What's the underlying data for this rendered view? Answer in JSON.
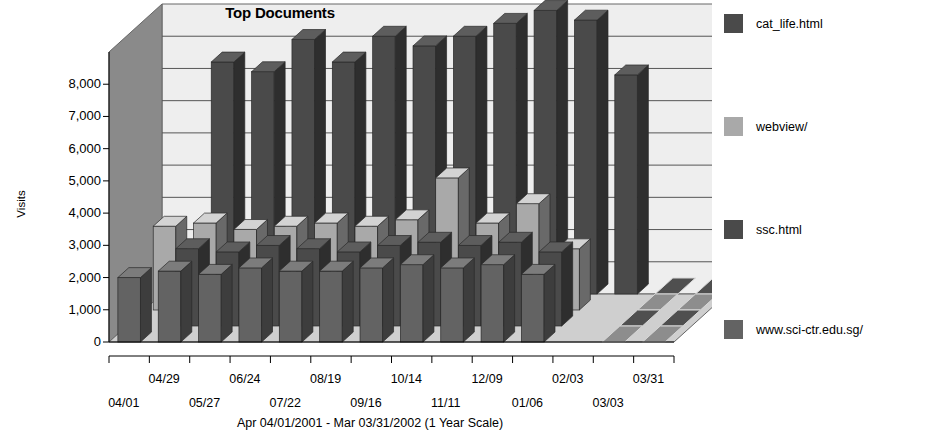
{
  "chart_data": {
    "type": "bar",
    "subtype": "3d-grouped-bar",
    "title": "Top Documents",
    "xlabel": "Apr 04/01/2001 - Mar 03/31/2002 (1 Year Scale)",
    "ylabel": "Visits",
    "ylim": [
      0,
      9000
    ],
    "ytick_labels": [
      "0",
      "1,000",
      "2,000",
      "3,000",
      "4,000",
      "5,000",
      "6,000",
      "7,000",
      "8,000"
    ],
    "ytick_values": [
      0,
      1000,
      2000,
      3000,
      4000,
      5000,
      6000,
      7000,
      8000
    ],
    "grid": true,
    "legend_position": "right",
    "categories": [
      "04/01",
      "04/29",
      "05/27",
      "06/24",
      "07/22",
      "08/19",
      "09/16",
      "10/14",
      "11/11",
      "12/09",
      "01/06",
      "02/03",
      "03/03",
      "03/31"
    ],
    "xtick_labels_upper": [
      "04/29",
      "06/24",
      "08/19",
      "10/14",
      "12/09",
      "02/03",
      "03/31"
    ],
    "xtick_labels_lower": [
      "04/01",
      "05/27",
      "07/22",
      "09/16",
      "11/11",
      "01/06",
      "03/03"
    ],
    "series": [
      {
        "name": "cat_life.html",
        "color": "#4a4a4a",
        "values": [
          null,
          7200,
          6900,
          7900,
          7200,
          8000,
          7700,
          8000,
          8400,
          8800,
          8500,
          6800,
          null,
          null
        ]
      },
      {
        "name": "webview/",
        "color": "#a9a9a9",
        "values": [
          2600,
          2700,
          2500,
          2600,
          2700,
          2600,
          2800,
          4100,
          2700,
          3300,
          1900,
          null,
          null,
          null
        ]
      },
      {
        "name": "ssc.html",
        "color": "#4a4a4a",
        "values": [
          null,
          2400,
          2300,
          2500,
          2400,
          2300,
          2500,
          2600,
          2500,
          2600,
          2300,
          null,
          null,
          null
        ]
      },
      {
        "name": "www.sci-ctr.edu.sg/",
        "color": "#636363",
        "values": [
          2000,
          2200,
          2100,
          2300,
          2200,
          2200,
          2300,
          2400,
          2300,
          2400,
          2100,
          null,
          null,
          null
        ]
      }
    ]
  },
  "legend": {
    "items": [
      {
        "label": "cat_life.html",
        "color": "#4a4a4a"
      },
      {
        "label": "webview/",
        "color": "#a9a9a9"
      },
      {
        "label": "ssc.html",
        "color": "#4a4a4a"
      },
      {
        "label": "www.sci-ctr.edu.sg/",
        "color": "#636363"
      }
    ]
  },
  "colors": {
    "plot_background": "#eeeeee",
    "wall_back": "#e9e9e9",
    "wall_side": "#8a8a8a",
    "floor": "#cfcfcf",
    "gridline": "#555555",
    "axis": "#000000"
  }
}
